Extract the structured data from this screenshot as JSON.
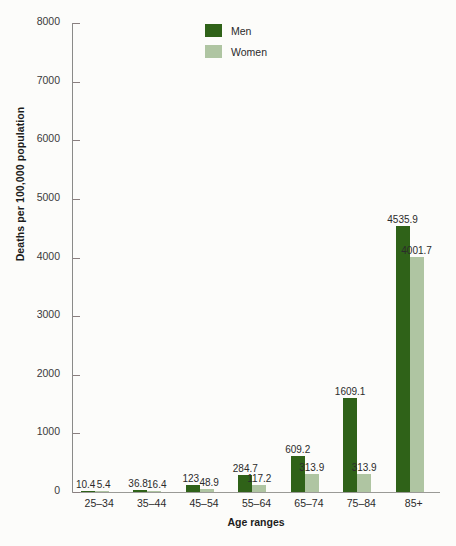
{
  "chart_data": {
    "type": "bar",
    "title": "",
    "xlabel": "Age ranges",
    "ylabel": "Deaths per 100,000 population",
    "ylim": [
      0,
      8000
    ],
    "yticks": [
      0,
      1000,
      2000,
      3000,
      4000,
      5000,
      6000,
      7000,
      8000
    ],
    "ytick_labels": [
      "0",
      "1000",
      "2000",
      "3000",
      "4000",
      "5000",
      "6000",
      "7000",
      "8000"
    ],
    "grid": false,
    "legend_position": "top-center",
    "categories": [
      "25–34",
      "35–44",
      "45–54",
      "55–64",
      "65–74",
      "75–84",
      "85+"
    ],
    "series": [
      {
        "name": "Men",
        "color": "#2f6218",
        "values": [
          10.4,
          36.8,
          123,
          284.7,
          609.2,
          1609.1,
          4535.9
        ],
        "labels": [
          "10.4",
          "36.8",
          "123",
          "284.7",
          "609.2",
          "1609.1",
          "4535.9"
        ]
      },
      {
        "name": "Women",
        "color": "#afc5a2",
        "values": [
          5.4,
          16.4,
          48.9,
          117.2,
          313.9,
          313.9,
          4001.7
        ],
        "labels": [
          "5.4",
          "16.4",
          "48.9",
          "117.2",
          "313.9",
          "313.9",
          "4001.7"
        ]
      }
    ]
  },
  "colors": {
    "men": "#2f6218",
    "women": "#afc5a2",
    "axis": "#8a8a88",
    "background": "#fcfcfa",
    "text": "#2b2b2b"
  }
}
